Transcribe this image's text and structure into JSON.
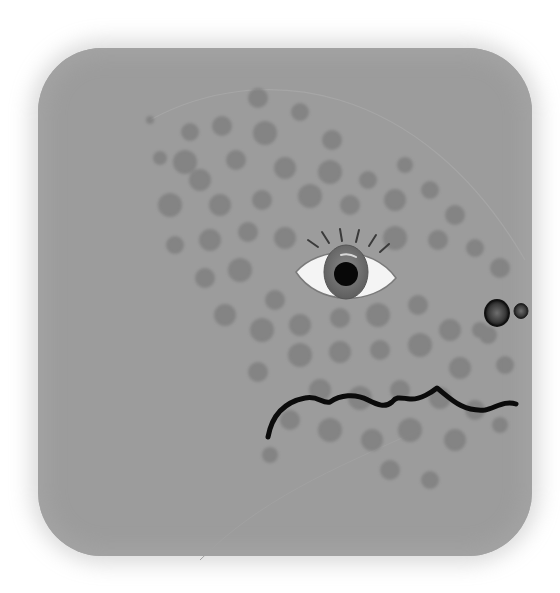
{
  "illustration": {
    "subject": "spotted creature face",
    "background_color": "#ffffff",
    "panel_color": "#9c9c9c",
    "spot_color": "#7a7a7a",
    "eye": {
      "cx": 346,
      "cy": 273,
      "sclera": "#f4f4f4",
      "iris": "#6e6e6e",
      "pupil": "#080808",
      "lashes": 5
    },
    "nostrils": [
      {
        "cx": 497,
        "cy": 313,
        "r": 10
      },
      {
        "cx": 521,
        "cy": 311,
        "r": 6
      }
    ],
    "mouth": {
      "stroke": "#0b0b0b",
      "stroke_width": 5
    },
    "spots": [
      [
        258,
        98,
        10
      ],
      [
        300,
        112,
        9
      ],
      [
        222,
        126,
        10
      ],
      [
        190,
        132,
        9
      ],
      [
        265,
        133,
        12
      ],
      [
        332,
        140,
        10
      ],
      [
        185,
        162,
        12
      ],
      [
        236,
        160,
        10
      ],
      [
        160,
        158,
        7
      ],
      [
        200,
        180,
        11
      ],
      [
        285,
        168,
        11
      ],
      [
        330,
        172,
        12
      ],
      [
        368,
        180,
        9
      ],
      [
        405,
        165,
        8
      ],
      [
        170,
        205,
        12
      ],
      [
        220,
        205,
        11
      ],
      [
        262,
        200,
        10
      ],
      [
        310,
        196,
        12
      ],
      [
        350,
        205,
        10
      ],
      [
        395,
        200,
        11
      ],
      [
        430,
        190,
        9
      ],
      [
        455,
        215,
        10
      ],
      [
        175,
        245,
        9
      ],
      [
        210,
        240,
        11
      ],
      [
        248,
        232,
        10
      ],
      [
        285,
        238,
        11
      ],
      [
        395,
        238,
        12
      ],
      [
        438,
        240,
        10
      ],
      [
        475,
        248,
        9
      ],
      [
        500,
        268,
        10
      ],
      [
        205,
        278,
        10
      ],
      [
        240,
        270,
        12
      ],
      [
        275,
        300,
        10
      ],
      [
        225,
        315,
        11
      ],
      [
        262,
        330,
        12
      ],
      [
        300,
        325,
        11
      ],
      [
        340,
        318,
        10
      ],
      [
        378,
        315,
        12
      ],
      [
        418,
        305,
        10
      ],
      [
        450,
        330,
        11
      ],
      [
        488,
        335,
        9
      ],
      [
        300,
        355,
        12
      ],
      [
        340,
        352,
        11
      ],
      [
        380,
        350,
        10
      ],
      [
        420,
        345,
        12
      ],
      [
        460,
        368,
        11
      ],
      [
        505,
        365,
        9
      ],
      [
        258,
        372,
        10
      ],
      [
        320,
        390,
        11
      ],
      [
        360,
        398,
        12
      ],
      [
        400,
        390,
        10
      ],
      [
        440,
        398,
        11
      ],
      [
        475,
        410,
        10
      ],
      [
        290,
        420,
        10
      ],
      [
        330,
        430,
        12
      ],
      [
        372,
        440,
        11
      ],
      [
        410,
        430,
        12
      ],
      [
        455,
        440,
        11
      ],
      [
        500,
        425,
        8
      ],
      [
        390,
        470,
        10
      ],
      [
        430,
        480,
        9
      ],
      [
        270,
        455,
        8
      ],
      [
        480,
        330,
        8
      ],
      [
        150,
        120,
        4
      ]
    ]
  }
}
